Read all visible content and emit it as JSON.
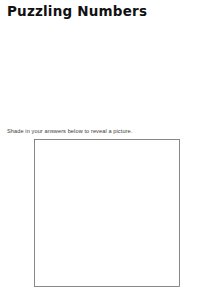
{
  "title": "Puzzling Numbers",
  "instruction": "Shade in your answers below to reveal a picture.",
  "tables": {
    "headers": [
      "factor",
      "factor",
      "product"
    ],
    "sets": [
      {
        "id": "table-top-left",
        "rows": [
          {
            "factor1": "45",
            "factor2": "4",
            "product": "180",
            "answer": "factor1"
          },
          {
            "factor1": "16",
            "factor2": "8",
            "product": "128",
            "answer": "product"
          },
          {
            "factor1": "55",
            "factor2": "5",
            "product": "275",
            "answer": "factor1"
          },
          {
            "factor1": "4",
            "factor2": "26",
            "product": "104",
            "answer": "factor2"
          }
        ]
      },
      {
        "id": "table-bottom-left",
        "rows": [
          {
            "factor1": "5",
            "factor2": "25",
            "product": "125",
            "answer": "factor2"
          },
          {
            "factor1": "44",
            "factor2": "7",
            "product": "308",
            "answer": "factor1"
          },
          {
            "factor1": "30",
            "factor2": "3",
            "product": "90",
            "answer": "product"
          },
          {
            "factor1": "42",
            "factor2": "20",
            "product": "840",
            "answer": "factor1"
          }
        ]
      },
      {
        "id": "table-top-right",
        "rows": [
          {
            "factor1": "3",
            "factor2": "41",
            "product": "123",
            "answer": "factor2"
          },
          {
            "factor1": "2",
            "factor2": "5",
            "product": "10",
            "answer": "factor1"
          },
          {
            "factor1": "6",
            "factor2": "53",
            "product": "318",
            "answer": "factor2"
          },
          {
            "factor1": "47",
            "factor2": "3",
            "product": "141",
            "answer": "product"
          }
        ]
      },
      {
        "id": "table-bottom-right",
        "rows": [
          {
            "factor1": "114",
            "factor2": "2",
            "product": "228",
            "answer": "product"
          },
          {
            "factor1": "6",
            "factor2": "33",
            "product": "198",
            "answer": "factor2"
          },
          {
            "factor1": "3",
            "factor2": "40",
            "product": "120",
            "answer": "factor1"
          },
          {
            "factor1": "2",
            "factor2": "66",
            "product": "132",
            "answer": "factor2"
          }
        ]
      }
    ]
  },
  "puzzle": {
    "shade_color": "#9a9a9a",
    "blank_color": "#ffffff",
    "line_color": "#7d7d7d",
    "cells": [
      {
        "label": "23",
        "shaded": false,
        "points": "4,6 22,4 26,18 8,22"
      },
      {
        "label": "59",
        "shaded": false,
        "points": "22,4 44,3 46,14 26,18"
      },
      {
        "label": "34",
        "shaded": false,
        "points": "44,3 62,2 64,12 46,14"
      },
      {
        "label": "45",
        "shaded": true,
        "points": "62,2 82,2 84,14 64,12"
      },
      {
        "label": "20",
        "shaded": false,
        "points": "82,2 96,2 97,12 84,14"
      },
      {
        "label": "128",
        "shaded": false,
        "points": "96,2 132,1 133,11 97,12"
      },
      {
        "label": "46",
        "shaded": true,
        "points": "132,1 142,1 143,12 133,11"
      },
      {
        "label": "103",
        "shaded": false,
        "points": "142,1 146,2 146,16 143,12"
      },
      {
        "label": "30",
        "shaded": false,
        "points": "2,18 8,22 12,36 1,34"
      },
      {
        "label": "14",
        "shaded": false,
        "points": "8,22 26,18 32,32 14,36"
      },
      {
        "label": "35",
        "shaded": true,
        "points": "26,18 46,14 48,30 32,32"
      },
      {
        "label": "44",
        "shaded": true,
        "points": "46,14 64,12 66,28 48,30"
      },
      {
        "label": "27",
        "shaded": false,
        "points": "64,12 97,12 98,24 66,28"
      },
      {
        "label": "16",
        "shaded": false,
        "points": "97,12 119,11 120,24 98,24"
      },
      {
        "label": "121",
        "shaded": false,
        "points": "119,11 143,12 144,26 120,24"
      },
      {
        "label": "123",
        "shaded": false,
        "points": "1,34 12,36 16,52 2,50"
      },
      {
        "label": "40",
        "shaded": false,
        "points": "12,36 32,32 34,48 16,52"
      },
      {
        "label": "9",
        "shaded": true,
        "points": "32,32 48,30 50,46 34,48"
      },
      {
        "label": "55",
        "shaded": true,
        "points": "48,30 66,28 70,44 50,46"
      },
      {
        "label": "58",
        "shaded": true,
        "points": "66,28 98,24 100,42 70,44"
      },
      {
        "label": "56",
        "shaded": true,
        "points": "98,24 120,24 122,40 100,42"
      },
      {
        "label": "126",
        "shaded": true,
        "points": "120,24 144,26 144,42 122,40"
      },
      {
        "label": "16",
        "shaded": false,
        "points": "144,26 146,28 146,44 144,42"
      },
      {
        "label": "41",
        "shaded": false,
        "points": "2,50 16,52 20,68 4,66"
      },
      {
        "label": "43",
        "shaded": true,
        "points": "34,48 50,46 52,62 36,64"
      },
      {
        "label": "41",
        "shaded": true,
        "points": "50,46 70,44 72,60 52,62"
      },
      {
        "label": "45",
        "shaded": true,
        "points": "70,44 100,42 104,58 72,60"
      },
      {
        "label": "46",
        "shaded": true,
        "points": "100,42 122,40 124,58 104,58"
      },
      {
        "label": "62",
        "shaded": true,
        "points": "122,40 144,42 145,58 124,58"
      },
      {
        "label": "7",
        "shaded": false,
        "points": "144,42 146,44 146,60 145,58"
      },
      {
        "label": "49",
        "shaded": false,
        "points": "4,66 20,68 22,82 6,80"
      },
      {
        "label": "62",
        "shaded": false,
        "points": "20,68 34,64 36,80 22,82"
      },
      {
        "label": "228",
        "shaded": true,
        "points": "36,64 52,62 54,80 38,82"
      },
      {
        "label": "180",
        "shaded": false,
        "points": "54,80 72,60 104,58 106,76 58,84"
      },
      {
        "label": "6",
        "shaded": true,
        "points": "104,58 124,58 126,76 106,76"
      },
      {
        "label": "10",
        "shaded": false,
        "points": "145,58 146,60 146,78 128,78"
      },
      {
        "label": "114",
        "shaded": false,
        "points": "6,80 22,82 26,98 8,96"
      },
      {
        "label": "104",
        "shaded": true,
        "points": "22,82 38,82 40,100 26,98"
      },
      {
        "label": "14",
        "shaded": false,
        "points": "58,84 106,76 100,94 62,98"
      },
      {
        "label": "55",
        "shaded": true,
        "points": "126,76 146,78 140,92 124,90"
      },
      {
        "label": "108",
        "shaded": false,
        "points": "8,96 26,98 28,112 10,112"
      },
      {
        "label": "36",
        "shaded": true,
        "points": "26,98 40,100 42,114 28,112"
      },
      {
        "label": "840",
        "shaded": false,
        "points": "42,114 40,100 62,98 78,104 66,118"
      },
      {
        "label": "132",
        "shaded": false,
        "points": "78,104 100,94 108,106 88,116"
      },
      {
        "label": "77",
        "shaded": false,
        "points": "100,94 124,90 126,104 108,106"
      },
      {
        "label": "134",
        "shaded": false,
        "points": "126,104 124,90 140,92 146,100 146,110"
      },
      {
        "label": "20",
        "shaded": false,
        "points": "10,112 28,112 30,128 12,128"
      },
      {
        "label": "40",
        "shaded": true,
        "points": "28,112 42,114 44,130 30,128"
      },
      {
        "label": "40",
        "shaded": false,
        "points": "44,130 42,114 66,118 70,130"
      },
      {
        "label": "318",
        "shaded": false,
        "points": "70,130 66,118 88,116 94,124 86,132"
      },
      {
        "label": "130",
        "shaded": false,
        "points": "88,116 108,106 126,104 122,122 100,126"
      },
      {
        "label": "111",
        "shaded": false,
        "points": "126,104 146,110 144,124 124,122"
      },
      {
        "label": "22",
        "shaded": false,
        "points": "146,78 146,100 140,92"
      },
      {
        "label": "51",
        "shaded": false,
        "points": "12,128 30,128 32,142 14,142"
      },
      {
        "label": "141",
        "shaded": true,
        "points": "30,128 44,130 46,144 32,142"
      },
      {
        "label": "15",
        "shaded": false,
        "points": "46,144 44,130 70,130 66,144"
      },
      {
        "label": "198",
        "shaded": false,
        "points": "66,144 70,130 86,132 90,146"
      },
      {
        "label": "55",
        "shaded": false,
        "points": "90,146 86,132 94,124 104,134 102,146"
      },
      {
        "label": "103",
        "shaded": false,
        "points": "102,146 104,134 122,122 124,136 118,146"
      },
      {
        "label": "47",
        "shaded": false,
        "points": "124,136 122,122 144,124 142,134"
      },
      {
        "label": "13",
        "shaded": false,
        "points": "142,134 144,124 146,126 146,140"
      },
      {
        "label": "69",
        "shaded": false,
        "points": "118,146 124,136 142,134 140,146"
      },
      {
        "label": "14",
        "shaded": false,
        "points": "144,124 146,110 146,126"
      },
      {
        "label": "2",
        "shaded": true,
        "points": "14,142 32,142 34,146 16,146"
      },
      {
        "label": "1",
        "shaded": false,
        "points": "2,146 14,142 16,146"
      },
      {
        "label": "4",
        "shaded": false,
        "points": "46,144 66,144 66,146 46,146"
      },
      {
        "label": "88",
        "shaded": false,
        "points": "90,146 102,146 100,140"
      },
      {
        "label": "104",
        "shaded": false,
        "points": "118,146 140,146 140,142"
      },
      {
        "label": "30",
        "shaded": false,
        "points": "140,146 146,140 146,146"
      },
      {
        "label": "5",
        "shaded": true,
        "points": "106,76 124,90 100,94"
      }
    ]
  }
}
